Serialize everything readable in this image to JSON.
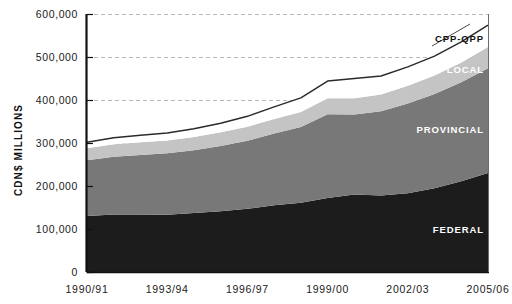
{
  "chart_data": {
    "type": "area",
    "title": "",
    "subtitle": "",
    "xlabel": "",
    "ylabel": "CDN$ MILLIONS",
    "stacked": true,
    "grid": true,
    "legend_position": "inline-right-annotations",
    "ylim": [
      0,
      600000
    ],
    "ytick_labels": [
      "600,000",
      "500,000",
      "400,000",
      "300,000",
      "200,000",
      "100,000",
      "0"
    ],
    "ytick_values": [
      600000,
      500000,
      400000,
      300000,
      200000,
      100000,
      0
    ],
    "xtick_labels": [
      "1990/91",
      "1993/94",
      "1996/97",
      "1999/00",
      "2002/03",
      "2005/06"
    ],
    "xtick_values": [
      "1990/91",
      "1993/94",
      "1996/97",
      "1999/00",
      "2002/03",
      "2005/06"
    ],
    "x": [
      "1990/91",
      "1991/92",
      "1992/93",
      "1993/94",
      "1994/95",
      "1995/96",
      "1996/97",
      "1997/98",
      "1998/99",
      "1999/00",
      "2000/01",
      "2001/02",
      "2002/03",
      "2003/04",
      "2004/05",
      "2005/06"
    ],
    "series": [
      {
        "name": "FEDERAL",
        "color": "#1c1c1c",
        "values": [
          130000,
          134000,
          134000,
          133000,
          137000,
          141000,
          147000,
          155000,
          161000,
          172000,
          180000,
          178000,
          183000,
          195000,
          211000,
          230000
        ]
      },
      {
        "name": "PROVINCIAL",
        "color": "#787878",
        "values": [
          130000,
          134000,
          138000,
          143000,
          146000,
          152000,
          158000,
          167000,
          176000,
          195000,
          186000,
          196000,
          209000,
          219000,
          230000,
          244000
        ]
      },
      {
        "name": "LOCAL",
        "color": "#c4c4c4",
        "values": [
          28000,
          29000,
          30000,
          30000,
          31000,
          32000,
          33000,
          34000,
          35000,
          37000,
          38000,
          39000,
          41000,
          43000,
          46000,
          49000
        ]
      },
      {
        "name": "CPP-QPP",
        "color": "#ffffff",
        "values": [
          14000,
          15000,
          16000,
          17000,
          19000,
          21000,
          24000,
          28000,
          33000,
          40000,
          46000,
          43000,
          44000,
          45000,
          48000,
          51000
        ]
      }
    ],
    "totals": [
      302000,
      312000,
      318000,
      323000,
      333000,
      346000,
      362000,
      384000,
      405000,
      444000,
      450000,
      456000,
      477000,
      502000,
      535000,
      574000
    ],
    "annotations": [
      {
        "text": "CPP-QPP",
        "series": "CPP-QPP"
      },
      {
        "text": "LOCAL",
        "series": "LOCAL"
      },
      {
        "text": "PROVINCIAL",
        "series": "PROVINCIAL"
      },
      {
        "text": "FEDERAL",
        "series": "FEDERAL"
      }
    ],
    "colors": {
      "federal": "#1c1c1c",
      "provincial": "#787878",
      "local": "#c4c4c4",
      "cpp_qpp": "#ffffff",
      "outline": "#2b2b2b",
      "grid": "#b8b8b8",
      "axis": "#111111",
      "background": "#ffffff"
    }
  }
}
